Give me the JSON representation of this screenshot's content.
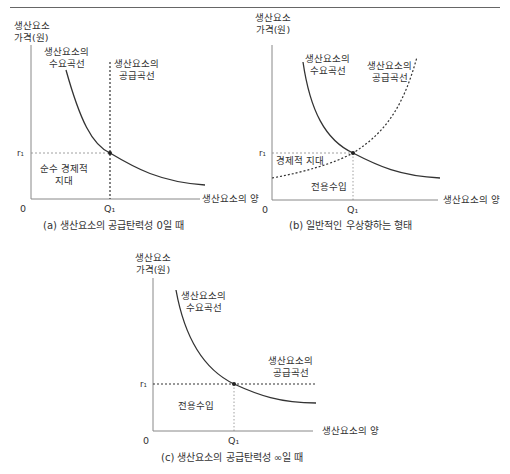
{
  "panels": {
    "a": {
      "y_axis_label_1": "생산요소",
      "y_axis_label_2": "가격(원)",
      "x_axis_label": "생산요소의 양",
      "origin": "0",
      "price_tick": "r₁",
      "qty_tick": "Q₁",
      "demand_label_1": "생산요소의",
      "demand_label_2": "수요곡선",
      "supply_label_1": "생산요소의",
      "supply_label_2": "공급곡선",
      "area_label_1": "순수 경제적",
      "area_label_2": "지대",
      "caption": "(a) 생산요소의 공급탄력성 0일 때"
    },
    "b": {
      "y_axis_label_1": "생산요소",
      "y_axis_label_2": "가격(원)",
      "x_axis_label": "생산요소의 양",
      "origin": "0",
      "price_tick": "r₁",
      "qty_tick": "Q₁",
      "demand_label_1": "생산요소의",
      "demand_label_2": "수요곡선",
      "supply_label_1": "생산요소의",
      "supply_label_2": "공급곡선",
      "rent_label": "경제적 지대",
      "transfer_label": "전용수입",
      "caption": "(b) 일반적인 우상향하는 형태"
    },
    "c": {
      "y_axis_label_1": "생산요소",
      "y_axis_label_2": "가격(원)",
      "x_axis_label": "생산요소의 양",
      "origin": "0",
      "price_tick": "r₁",
      "qty_tick": "Q₁",
      "demand_label_1": "생산요소의",
      "demand_label_2": "수요곡선",
      "supply_label_1": "생산요소의",
      "supply_label_2": "공급곡선",
      "transfer_label": "전용수입",
      "caption": "(c) 생산요소의 공급탄력성 ∞일 때"
    }
  },
  "colors": {
    "axis": "#888888",
    "curve": "#333333",
    "guide": "#888888"
  }
}
